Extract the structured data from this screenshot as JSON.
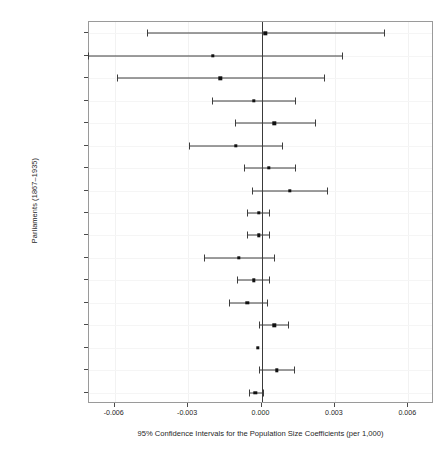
{
  "chart_data": {
    "type": "scatter",
    "subtype": "forest-plot-confidence-intervals",
    "title": "",
    "xlabel": "95% Confidence Intervals for the Population Size Coefficients (per 1,000)",
    "ylabel": "Parliaments (1867–1935)",
    "xlim": [
      -0.00705,
      0.00705
    ],
    "xticks": [
      -0.006,
      -0.003,
      0.0,
      0.003,
      0.006
    ],
    "xticklabels": [
      "-0.006",
      "-0.003",
      "0.000",
      "0.003",
      "0.006"
    ],
    "grid": true,
    "legend": false,
    "reference_line": 0.0,
    "categories": [
      "1st (1867–1872)",
      "2nd (1872–1874)",
      "3rd (1874–1878)",
      "4th (1879–1882)",
      "5th (1883–1887)",
      "6th (1887–1891)",
      "7th (1891–1896)",
      "8th (1896–1900)",
      "9th (1901–1904)",
      "10th (1905–1908)",
      "11th (1909–1911)",
      "12th (1911–1917)",
      "13th (1917–1921)",
      "14th (1921–1925)",
      "15th (1926)",
      "16th (1926–1930)",
      "17th (1930–1935)"
    ],
    "estimates": [
      0.00016,
      -0.00199,
      -0.00168,
      -0.00031,
      0.00052,
      -0.00105,
      0.00031,
      0.00115,
      -0.0001,
      -0.0001,
      -0.00094,
      -0.00031,
      -0.00058,
      0.00052,
      -0.00016,
      0.00063,
      -0.00026
    ],
    "ci_lower": [
      -0.0047,
      -0.00711,
      -0.00591,
      -0.00204,
      -0.0011,
      -0.00298,
      -0.00073,
      -0.00037,
      -0.00058,
      -0.00058,
      -0.00235,
      -0.00099,
      -0.00131,
      -0.0001,
      -0.00016,
      -0.0001,
      -0.00052
    ],
    "ci_upper": [
      0.00502,
      0.00329,
      0.00256,
      0.00136,
      0.0022,
      0.00084,
      0.00136,
      0.00267,
      0.00031,
      0.00031,
      0.00052,
      0.00031,
      0.00021,
      0.0011,
      -0.00016,
      0.00131,
      5e-05
    ]
  },
  "axis": {
    "ylabel": "Parliaments (1867–1935)",
    "xlabel": "95% Confidence Intervals for the Population Size Coefficients (per 1,000)"
  }
}
